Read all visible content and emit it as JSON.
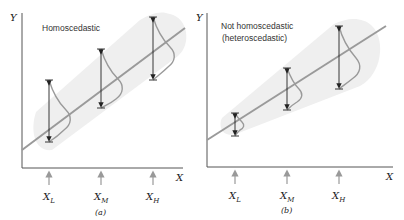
{
  "panels": [
    {
      "id": "a",
      "title": "Homoscedastic",
      "title_line2": "",
      "caption": "(a)",
      "y_axis_label": "Y",
      "x_axis_label": "X",
      "x_points": [
        {
          "label": "X",
          "sub": "L"
        },
        {
          "label": "X",
          "sub": "M"
        },
        {
          "label": "X",
          "sub": "H"
        }
      ]
    },
    {
      "id": "b",
      "title": "Not homoscedastic",
      "title_line2": "(heteroscedastic)",
      "caption": "(b)",
      "y_axis_label": "Y",
      "x_axis_label": "X",
      "x_points": [
        {
          "label": "X",
          "sub": "L"
        },
        {
          "label": "X",
          "sub": "M"
        },
        {
          "label": "X",
          "sub": "H"
        }
      ]
    }
  ],
  "colors": {
    "axis": "#555555",
    "regression_line": "#9a9a9a",
    "band": "#efefef",
    "arrow": "#222222",
    "tick_arrow": "#999999"
  }
}
